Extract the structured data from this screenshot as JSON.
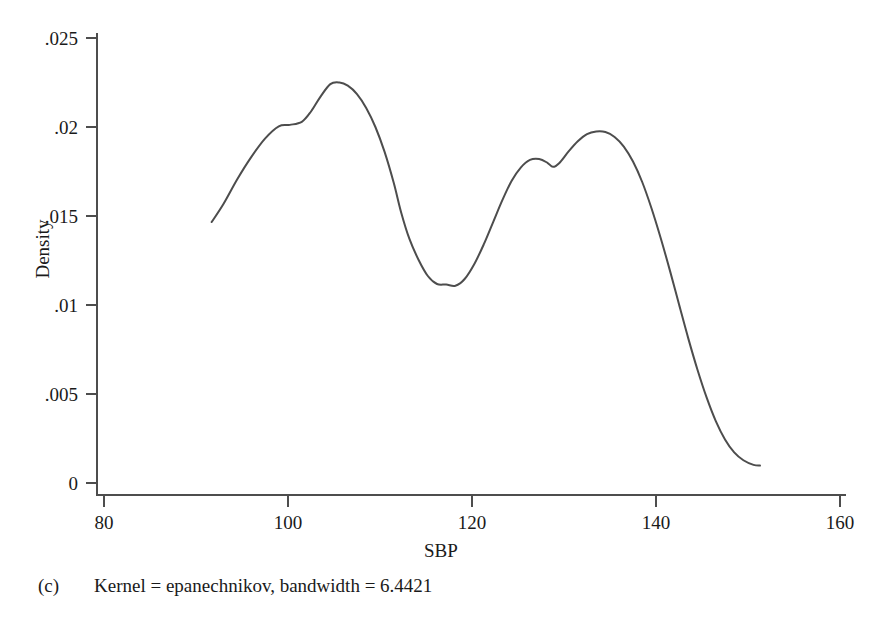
{
  "figure": {
    "panel_letter": "(c)",
    "caption": "Kernel = epanechnikov, bandwidth = 6.4421"
  },
  "chart_data": {
    "type": "line",
    "title": "",
    "subtitle": "",
    "xlabel": "SBP",
    "ylabel": "Density",
    "xlim": [
      80,
      160
    ],
    "ylim": [
      0,
      0.025
    ],
    "grid": false,
    "legend": null,
    "xticks": [
      80,
      100,
      120,
      140,
      160
    ],
    "xtick_labels": [
      "80",
      "100",
      "120",
      "140",
      "160"
    ],
    "yticks": [
      0,
      0.005,
      0.01,
      0.015,
      0.02,
      0.025
    ],
    "ytick_labels": [
      "0",
      ".005",
      ".01",
      ".015",
      ".02",
      ".025"
    ],
    "line_color": "#4d4d4d",
    "line_width": 2,
    "series": [
      {
        "name": "Kernel density of SBP",
        "x": [
          91.7,
          93.0,
          94.5,
          96.0,
          97.5,
          99.0,
          100.2,
          101.5,
          102.5,
          103.5,
          104.6,
          105.6,
          106.5,
          107.5,
          108.5,
          109.5,
          110.5,
          111.5,
          112.3,
          113.2,
          114.2,
          115.2,
          116.2,
          117.2,
          118.2,
          119.2,
          120.3,
          121.3,
          122.3,
          123.3,
          124.3,
          125.3,
          126.3,
          127.3,
          128.2,
          128.8,
          129.5,
          130.5,
          131.5,
          132.5,
          133.5,
          134.5,
          135.5,
          136.5,
          137.5,
          138.5,
          139.5,
          140.5,
          141.5,
          142.5,
          143.5,
          144.5,
          145.5,
          146.5,
          147.5,
          148.5,
          149.5,
          150.6,
          151.3
        ],
        "y": [
          0.01466,
          0.01569,
          0.01708,
          0.01831,
          0.01935,
          0.02004,
          0.02012,
          0.02029,
          0.02087,
          0.02168,
          0.02241,
          0.0225,
          0.02232,
          0.02185,
          0.02107,
          0.02,
          0.0186,
          0.01685,
          0.0152,
          0.01371,
          0.01253,
          0.01163,
          0.01118,
          0.01115,
          0.01108,
          0.01146,
          0.01235,
          0.01343,
          0.01466,
          0.01589,
          0.01697,
          0.01772,
          0.01815,
          0.0182,
          0.01799,
          0.01776,
          0.01798,
          0.01863,
          0.0192,
          0.0196,
          0.01975,
          0.01972,
          0.01944,
          0.0189,
          0.01806,
          0.01691,
          0.01545,
          0.01378,
          0.01196,
          0.01004,
          0.00814,
          0.00638,
          0.00481,
          0.00348,
          0.00245,
          0.00172,
          0.00128,
          0.00102,
          0.00098
        ]
      }
    ]
  }
}
